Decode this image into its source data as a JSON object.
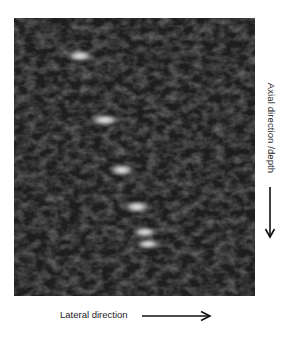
{
  "figure": {
    "type": "ultrasound-b-mode",
    "background_color": "#262626",
    "point_targets": [
      {
        "cx": 66,
        "cy": 38,
        "rx": 16,
        "ry": 7
      },
      {
        "cx": 91,
        "cy": 102,
        "rx": 17,
        "ry": 7
      },
      {
        "cx": 108,
        "cy": 152,
        "rx": 15,
        "ry": 7
      },
      {
        "cx": 123,
        "cy": 189,
        "rx": 15,
        "ry": 7
      },
      {
        "cx": 131,
        "cy": 214,
        "rx": 15,
        "ry": 6
      },
      {
        "cx": 134,
        "cy": 226,
        "rx": 15,
        "ry": 6
      }
    ]
  },
  "labels": {
    "axial": "Axial direction /depth",
    "lateral": "Lateral direction"
  },
  "icons": {
    "axial_arrow": "arrow-down-icon",
    "lateral_arrow": "arrow-right-icon"
  }
}
